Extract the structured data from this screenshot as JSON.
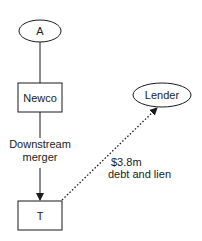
{
  "diagram": {
    "nodes": {
      "a": {
        "label": "A",
        "shape": "ellipse"
      },
      "newco": {
        "label": "Newco",
        "shape": "rect"
      },
      "t": {
        "label": "T",
        "shape": "rect"
      },
      "lender": {
        "label": "Lender",
        "shape": "ellipse"
      }
    },
    "edges": {
      "a_newco": {
        "style": "solid",
        "arrow": false
      },
      "merger": {
        "label_line1": "Downstream",
        "label_line2": "merger",
        "style": "solid",
        "arrow": true
      },
      "debt": {
        "label_line1": "$3.8m",
        "label_line2": "debt and lien",
        "style": "dotted",
        "arrow": true
      }
    },
    "colors": {
      "stroke": "#1a1a1a",
      "background": "#ffffff"
    }
  }
}
